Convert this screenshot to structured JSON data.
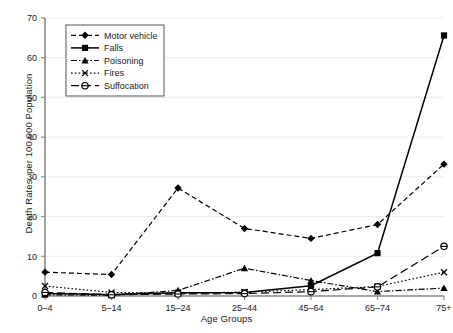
{
  "chart_data": {
    "type": "line",
    "title": "",
    "xlabel": "Age Groups",
    "ylabel": "Death Rates, per 100,000 Population",
    "categories": [
      "0–4",
      "5–14",
      "15–24",
      "25–44",
      "45–64",
      "65–74",
      "75+"
    ],
    "ylim": [
      0,
      70
    ],
    "yticks": [
      0,
      10,
      20,
      30,
      40,
      50,
      60,
      70
    ],
    "grid": true,
    "legend_position": "top-left",
    "series": [
      {
        "name": "Motor vehicle",
        "marker": "diamond",
        "line_style": "dashed",
        "color": "#000000",
        "values": [
          6.0,
          5.4,
          27.2,
          17.0,
          14.5,
          18.0,
          33.2
        ]
      },
      {
        "name": "Falls",
        "marker": "square",
        "line_style": "solid",
        "color": "#000000",
        "values": [
          0.6,
          0.4,
          0.8,
          0.9,
          2.6,
          10.8,
          65.6
        ]
      },
      {
        "name": "Poisoning",
        "marker": "triangle",
        "line_style": "dashdot",
        "color": "#000000",
        "values": [
          0.3,
          0.2,
          1.4,
          7.0,
          3.9,
          1.1,
          2.0
        ]
      },
      {
        "name": "Fires",
        "marker": "cross",
        "line_style": "dotted",
        "color": "#000000",
        "values": [
          2.5,
          0.9,
          0.7,
          1.0,
          1.6,
          2.4,
          6.0
        ]
      },
      {
        "name": "Suffocation",
        "marker": "circle-open",
        "line_style": "longdash",
        "color": "#000000",
        "values": [
          0.9,
          0.3,
          0.5,
          0.6,
          1.1,
          2.3,
          12.5
        ]
      }
    ]
  },
  "axes": {
    "y_tick_labels": [
      "0",
      "10",
      "20",
      "30",
      "40",
      "50",
      "60",
      "70"
    ],
    "x_tick_labels": [
      "0–4",
      "5–14",
      "15–24",
      "25–44",
      "45–64",
      "65–74",
      "75+"
    ]
  },
  "legend": {
    "entries": [
      {
        "label": "Motor vehicle"
      },
      {
        "label": "Falls"
      },
      {
        "label": "Poisoning"
      },
      {
        "label": "Fires"
      },
      {
        "label": "Suffocation"
      }
    ]
  },
  "colors": {
    "ink": "#000000",
    "axis": "#8a8a8a",
    "grid": "#ececec",
    "background": "#ffffff"
  }
}
